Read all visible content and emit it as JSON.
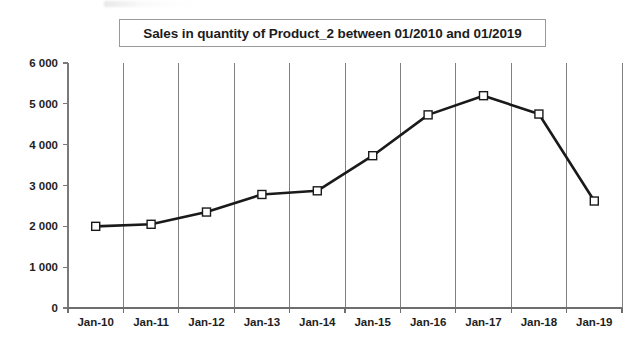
{
  "chart_data": {
    "type": "line",
    "title": "Sales in quantity of Product_2 between 01/2010 and 01/2019",
    "xlabel": "",
    "ylabel": "",
    "categories": [
      "Jan-10",
      "Jan-11",
      "Jan-12",
      "Jan-13",
      "Jan-14",
      "Jan-15",
      "Jan-16",
      "Jan-17",
      "Jan-18",
      "Jan-19"
    ],
    "values": [
      2000,
      2050,
      2350,
      2780,
      2870,
      3730,
      4730,
      5200,
      4750,
      2620
    ],
    "series": [
      {
        "name": "Product_2",
        "values": [
          2000,
          2050,
          2350,
          2780,
          2870,
          3730,
          4730,
          5200,
          4750,
          2620
        ]
      }
    ],
    "ylim": [
      0,
      6000
    ],
    "ytick_values": [
      0,
      1000,
      2000,
      3000,
      4000,
      5000,
      6000
    ],
    "ytick_labels": [
      "0",
      "1 000",
      "2 000",
      "3 000",
      "4 000",
      "5 000",
      "6 000"
    ],
    "grid": "vertical-only",
    "legend": "none",
    "marker": "open-square",
    "line_color": "#1a1a1a",
    "marker_fill": "#ffffff",
    "marker_stroke": "#1a1a1a",
    "gridline_color": "#808080",
    "axis_color": "#7a7a7a"
  }
}
